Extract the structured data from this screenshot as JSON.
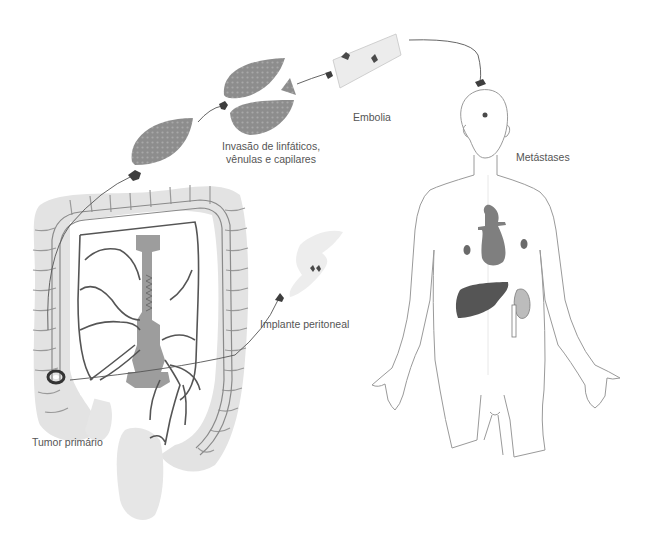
{
  "diagram": {
    "type": "metastasis-process-illustration",
    "labels": {
      "invasion_line1": "Invasão de linfáticos,",
      "invasion_line2": "vênulas e capilares",
      "embolism": "Embolia",
      "metastases": "Metástases",
      "peritoneal_implant": "Implante peritoneal",
      "primary_tumor": "Tumor primário"
    },
    "colors": {
      "background": "#ffffff",
      "colon_fill": "#e3e3e3",
      "vessel_stroke": "#5a5a5a",
      "spine_fill": "#9d9d9d",
      "tissue_fill": "#8f8f8f",
      "cell_cluster": "#4a4a4a",
      "organ_dark": "#555555",
      "organ_mid": "#7f7f7f",
      "organ_light": "#bcbcbc",
      "body_outline": "#9a9a9a",
      "vessel_tube": "#ececec",
      "text": "#555555"
    },
    "stages": [
      {
        "id": "primary-tumor",
        "label_key": "primary_tumor"
      },
      {
        "id": "invasion",
        "label_key": "invasion_line1"
      },
      {
        "id": "embolism",
        "label_key": "embolism"
      },
      {
        "id": "metastases",
        "label_key": "metastases"
      },
      {
        "id": "peritoneal-implant",
        "label_key": "peritoneal_implant"
      }
    ]
  }
}
